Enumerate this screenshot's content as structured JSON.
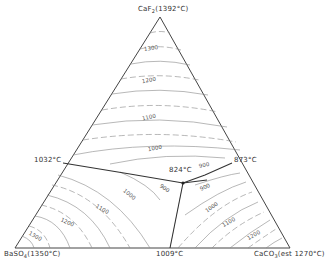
{
  "diagram": {
    "type": "ternary-phase-diagram",
    "vertices": {
      "top": {
        "formula": "CaF",
        "sub": "2",
        "temp": "(1392°C)"
      },
      "bottom_left": {
        "formula": "BaSO",
        "sub": "4",
        "temp": "(1350°C)"
      },
      "bottom_right": {
        "formula": "CaCO",
        "sub": "3",
        "temp": "(est 1270°C)"
      }
    },
    "binary_eutectics": {
      "left": "1032°C",
      "right": "873°C",
      "bottom": "1009°C"
    },
    "ternary_eutectic": "824°C",
    "isotherm_labels": {
      "top_1300": "1300",
      "top_1200": "1200",
      "top_1100": "1100",
      "top_1000": "1000",
      "top_900": "900",
      "right_900": "900",
      "right_1000": "1000",
      "right_1100": "1100",
      "right_1200": "1200",
      "left_900": "900",
      "left_1000": "1000",
      "left_1100": "1100",
      "left_1200": "1200",
      "left_1300": "1300"
    }
  }
}
